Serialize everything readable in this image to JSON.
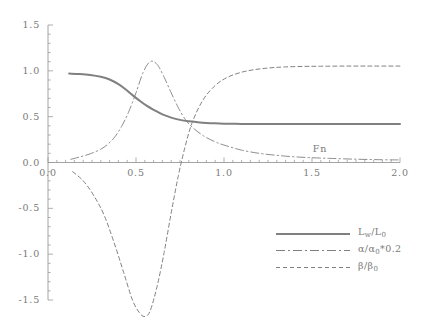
{
  "chart_data": {
    "type": "line",
    "title": "",
    "xlabel": "Fn",
    "ylabel": "",
    "xlim": [
      0.0,
      2.0
    ],
    "ylim": [
      -1.5,
      1.5
    ],
    "grid": false,
    "legend_position": "lower-right",
    "x_ticks": [
      "0.0",
      "0.5",
      "1.0",
      "1.5",
      "2.0"
    ],
    "x_tick_values": [
      0.0,
      0.5,
      1.0,
      1.5,
      2.0
    ],
    "y_ticks": [
      "-1.5",
      "-1.0",
      "-0.5",
      "0.0",
      "0.5",
      "1.0",
      "1.5"
    ],
    "y_tick_values": [
      -1.5,
      -1.0,
      -0.5,
      0.0,
      0.5,
      1.0,
      1.5
    ],
    "line_color": "#808080",
    "axis_color": "#9a9a9a",
    "series": [
      {
        "name": "Lw/L0",
        "style": "solid",
        "x": [
          0.12,
          0.18,
          0.24,
          0.3,
          0.35,
          0.4,
          0.44,
          0.48,
          0.52,
          0.56,
          0.6,
          0.65,
          0.7,
          0.75,
          0.8,
          0.85,
          0.9,
          0.95,
          1.0,
          1.1,
          1.2,
          1.4,
          1.6,
          1.8,
          2.0
        ],
        "y": [
          0.97,
          0.965,
          0.955,
          0.935,
          0.905,
          0.855,
          0.8,
          0.735,
          0.675,
          0.62,
          0.575,
          0.525,
          0.49,
          0.465,
          0.45,
          0.44,
          0.432,
          0.427,
          0.424,
          0.421,
          0.42,
          0.42,
          0.42,
          0.42,
          0.42
        ]
      },
      {
        "name": "alpha/alpha0*0.2",
        "style": "dashdot",
        "x": [
          0.13,
          0.18,
          0.24,
          0.3,
          0.34,
          0.38,
          0.42,
          0.46,
          0.5,
          0.54,
          0.58,
          0.62,
          0.66,
          0.7,
          0.74,
          0.78,
          0.82,
          0.88,
          0.95,
          1.0,
          1.1,
          1.2,
          1.3,
          1.4,
          1.5,
          1.6,
          1.75,
          1.9,
          2.0
        ],
        "y": [
          0.035,
          0.06,
          0.095,
          0.145,
          0.2,
          0.28,
          0.4,
          0.56,
          0.76,
          0.98,
          1.1,
          1.07,
          0.93,
          0.76,
          0.6,
          0.47,
          0.385,
          0.295,
          0.225,
          0.19,
          0.135,
          0.1,
          0.078,
          0.062,
          0.052,
          0.045,
          0.036,
          0.03,
          0.028
        ]
      },
      {
        "name": "beta/beta0",
        "style": "dashed",
        "x": [
          0.14,
          0.2,
          0.26,
          0.32,
          0.38,
          0.43,
          0.48,
          0.52,
          0.55,
          0.58,
          0.62,
          0.66,
          0.7,
          0.74,
          0.78,
          0.82,
          0.88,
          0.95,
          1.02,
          1.1,
          1.18,
          1.26,
          1.34,
          1.45,
          1.55,
          1.7,
          1.85,
          2.0
        ],
        "y": [
          -0.1,
          -0.2,
          -0.36,
          -0.58,
          -0.9,
          -1.2,
          -1.5,
          -1.64,
          -1.68,
          -1.62,
          -1.35,
          -0.98,
          -0.55,
          -0.15,
          0.18,
          0.44,
          0.68,
          0.84,
          0.93,
          0.985,
          1.015,
          1.032,
          1.042,
          1.048,
          1.05,
          1.052,
          1.052,
          1.052
        ]
      }
    ],
    "annotations": [
      {
        "text": "Fn",
        "x": 1.55,
        "y": 0.14
      }
    ]
  },
  "legend": {
    "items": [
      {
        "label_html": "L<sub>w</sub>/L<sub>0</sub>",
        "style": "solid"
      },
      {
        "label_html": "α/α<sub>0</sub>*0.2",
        "style": "dashdot"
      },
      {
        "label_html": "β/β<sub>0</sub>",
        "style": "dashed"
      }
    ]
  }
}
